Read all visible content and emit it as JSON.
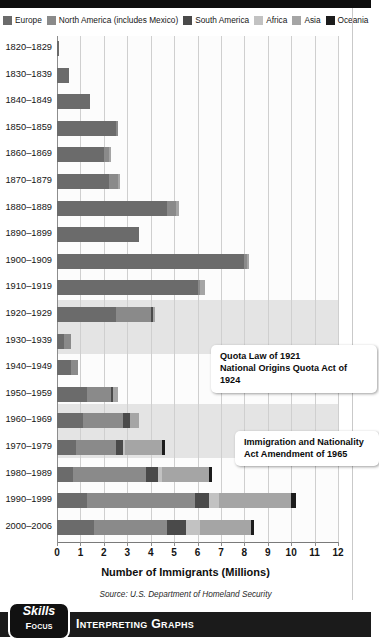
{
  "legend": {
    "items": [
      {
        "label": "Europe",
        "color": "#6b6b6b"
      },
      {
        "label": "North America (includes Mexico)",
        "color": "#8a8a8a"
      },
      {
        "label": "South America",
        "color": "#4a4a4a"
      },
      {
        "label": "Africa",
        "color": "#c2c2c2"
      },
      {
        "label": "Asia",
        "color": "#a5a5a5"
      },
      {
        "label": "Oceania",
        "color": "#1c1c1c"
      }
    ]
  },
  "chart_data": {
    "type": "bar",
    "orientation": "horizontal",
    "stacked": true,
    "title": "",
    "xlabel": "Number of Immigrants (Millions)",
    "ylabel": "",
    "xlim": [
      0,
      12
    ],
    "xticks": [
      "0",
      "1",
      "2",
      "3",
      "4",
      "5",
      "6",
      "7",
      "8",
      "9",
      "10",
      "11",
      "12"
    ],
    "grid": true,
    "legend_position": "top",
    "categories": [
      "1820–1829",
      "1830–1839",
      "1840–1849",
      "1850–1859",
      "1860–1869",
      "1870–1879",
      "1880–1889",
      "1890–1899",
      "1900–1909",
      "1910–1919",
      "1920–1929",
      "1930–1939",
      "1940–1949",
      "1950–1959",
      "1960–1969",
      "1970–1979",
      "1980–1989",
      "1990–1999",
      "2000–2006"
    ],
    "series": [
      {
        "name": "Europe",
        "color": "#6b6b6b",
        "values": [
          0.1,
          0.5,
          1.4,
          2.5,
          2.0,
          2.2,
          4.7,
          3.5,
          8.0,
          6.0,
          2.5,
          0.3,
          0.6,
          1.3,
          1.1,
          0.8,
          0.7,
          1.3,
          1.6
        ]
      },
      {
        "name": "North America (includes Mexico)",
        "color": "#8a8a8a",
        "values": [
          0.0,
          0.0,
          0.0,
          0.1,
          0.2,
          0.4,
          0.4,
          0.0,
          0.1,
          0.1,
          1.5,
          0.3,
          0.3,
          1.0,
          1.7,
          1.7,
          3.1,
          4.6,
          3.1
        ]
      },
      {
        "name": "South America",
        "color": "#4a4a4a",
        "values": [
          0.0,
          0.0,
          0.0,
          0.0,
          0.0,
          0.0,
          0.0,
          0.0,
          0.0,
          0.0,
          0.1,
          0.0,
          0.0,
          0.1,
          0.3,
          0.3,
          0.5,
          0.6,
          0.8
        ]
      },
      {
        "name": "Africa",
        "color": "#c2c2c2",
        "values": [
          0.0,
          0.0,
          0.0,
          0.0,
          0.0,
          0.0,
          0.0,
          0.0,
          0.0,
          0.0,
          0.0,
          0.0,
          0.0,
          0.0,
          0.0,
          0.1,
          0.2,
          0.4,
          0.6
        ]
      },
      {
        "name": "Asia",
        "color": "#a5a5a5",
        "values": [
          0.0,
          0.0,
          0.0,
          0.0,
          0.1,
          0.1,
          0.1,
          0.0,
          0.1,
          0.2,
          0.1,
          0.0,
          0.0,
          0.2,
          0.4,
          1.6,
          2.0,
          3.1,
          2.2
        ]
      },
      {
        "name": "Oceania",
        "color": "#1c1c1c",
        "values": [
          0.0,
          0.0,
          0.0,
          0.0,
          0.0,
          0.0,
          0.0,
          0.0,
          0.0,
          0.0,
          0.0,
          0.0,
          0.0,
          0.0,
          0.0,
          0.1,
          0.1,
          0.2,
          0.1
        ]
      }
    ],
    "totals": [
      0.1,
      0.5,
      1.4,
      2.6,
      2.3,
      2.7,
      5.2,
      3.5,
      8.2,
      6.3,
      4.2,
      0.6,
      0.9,
      2.6,
      3.5,
      4.6,
      6.6,
      10.2,
      8.4
    ],
    "annotations": [
      {
        "id": "quota-callout",
        "lines": [
          "Quota Law of 1921",
          "National Origins Quota Act of 1924"
        ],
        "line1": "Quota Law of 1921",
        "line2": "National Origins Quota Act of 1924"
      },
      {
        "id": "immigration-act-callout",
        "lines": [
          "Immigration and Nationality",
          "Act Amendment of 1965"
        ],
        "line1": "Immigration and Nationality",
        "line2": "Act Amendment of 1965"
      }
    ],
    "source": "Source: U.S. Department of Homeland Security"
  },
  "banner": {
    "skills_word": "Skills",
    "focus_word": "Focus",
    "title": "Interpreting Graphs"
  }
}
